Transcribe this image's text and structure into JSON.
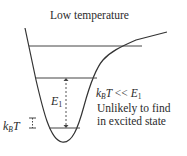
{
  "figure": {
    "title": "Low temperature",
    "labels": {
      "energy_gap": {
        "symbol": "E",
        "subscript": "1"
      },
      "thermal_energy": {
        "symbol_k": "k",
        "subscript": "B",
        "symbol_T": "T"
      },
      "condition": {
        "lhs_k": "k",
        "lhs_sub": "B",
        "lhs_T": "T ",
        "operator": "<<",
        "rhs": "E",
        "rhs_sub": "1"
      },
      "note_line1": "Unlikely to find",
      "note_line2": "in excited state"
    },
    "elements": [
      "potential-well-curve",
      "dissociation-energy-level",
      "excited-state-level",
      "ground-state-level",
      "energy-gap-dashed-arrow",
      "thermal-energy-marker"
    ],
    "colors": {
      "line": "#333333",
      "text": "#2b2b2b",
      "background": "#ffffff"
    }
  }
}
